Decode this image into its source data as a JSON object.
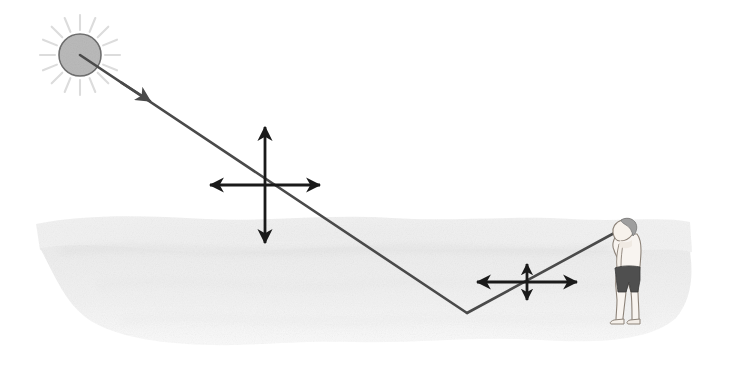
{
  "figure": {
    "background_color": "#ffffff",
    "width": 730,
    "height": 379
  },
  "colors": {
    "ray": "#4a4a4a",
    "arrow": "#1a1a1a",
    "sun_fill": "#b0b0b0",
    "sun_stroke": "#6e6e6e",
    "sun_rays": "#dcdcdc",
    "ground_light": "#f0f0f0",
    "ground_shade": "#e6e6e6",
    "skin": "#f7f2ee",
    "skin_outline": "#8c8278",
    "shorts": "#4d4d4d",
    "hair": "#9a9a9a"
  },
  "sun": {
    "label": "sun",
    "center_x": 80,
    "center_y": 55,
    "radius": 21,
    "ray_count": 16,
    "ray_inner": 25,
    "ray_outer": 40
  },
  "incident_ray": {
    "label": "incident sunlight ray",
    "from_x": 80,
    "from_y": 55,
    "to_x": 467,
    "to_y": 313,
    "arrowhead_x": 150,
    "arrowhead_y": 101,
    "stroke_width": 2.6
  },
  "reflected_ray": {
    "label": "reflected ray to observer",
    "from_x": 467,
    "from_y": 313,
    "to_x": 618,
    "to_y": 231,
    "stroke_width": 2.6
  },
  "reflection_point": {
    "label": "point of reflection on surface",
    "x": 467,
    "y": 313
  },
  "polarization_symbols": [
    {
      "name": "incident-polarization-cross",
      "description": "unpolarized light: equal vertical and horizontal double arrows",
      "center_x": 265,
      "center_y": 185,
      "horizontal_half_length": 55,
      "vertical_half_length": 58,
      "stroke_width": 2.8
    },
    {
      "name": "reflected-polarization-cross",
      "description": "partially polarized light: long horizontal, short vertical double arrows",
      "center_x": 527,
      "center_y": 282,
      "horizontal_half_length": 50,
      "vertical_half_length": 18,
      "stroke_width": 2.8
    }
  ],
  "ground": {
    "label": "reflecting ground / water surface",
    "left_x": 33,
    "right_x": 692,
    "top_y": 212,
    "bottom_y": 348
  },
  "observer": {
    "label": "observer standing on the surface",
    "facing": "left",
    "head_x": 622,
    "head_y": 228,
    "feet_y": 322,
    "height_px": 100,
    "wearing": "shorts"
  }
}
